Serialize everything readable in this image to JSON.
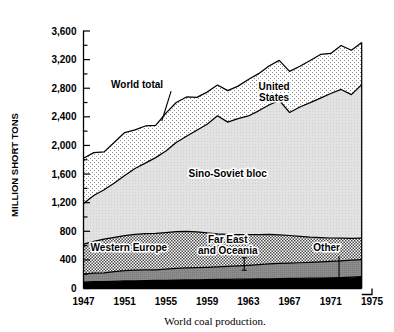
{
  "chart_data": {
    "type": "area",
    "stacked": true,
    "title": "",
    "caption": "World coal production.",
    "xlabel": "",
    "ylabel": "MILLION SHORT TONS",
    "xlim": [
      1947,
      1975
    ],
    "ylim": [
      0,
      3600
    ],
    "grid": false,
    "legend": "inline-labels",
    "y_ticks_major": [
      "0",
      "400",
      "800",
      "1,200",
      "1,600",
      "2,000",
      "2,400",
      "2,800",
      "3,200",
      "3,600"
    ],
    "y_ticks_major_values": [
      0,
      400,
      800,
      1200,
      1600,
      2000,
      2400,
      2800,
      3200,
      3600
    ],
    "y_ticks_minor_values": [
      200,
      600,
      1000,
      1400,
      1800,
      2200,
      2600,
      3000,
      3400
    ],
    "x_ticks": [
      "1947",
      "1951",
      "1955",
      "1959",
      "1963",
      "1967",
      "1971",
      "1975"
    ],
    "x_tick_values": [
      1947,
      1951,
      1955,
      1959,
      1963,
      1967,
      1971,
      1975
    ],
    "x": [
      1947,
      1948,
      1949,
      1950,
      1951,
      1952,
      1953,
      1954,
      1955,
      1956,
      1957,
      1958,
      1959,
      1960,
      1961,
      1962,
      1963,
      1964,
      1965,
      1966,
      1967,
      1968,
      1969,
      1970,
      1971,
      1972,
      1973,
      1974
    ],
    "series": [
      {
        "name": "Other",
        "fill": "black",
        "values": [
          90,
          95,
          95,
          100,
          105,
          108,
          110,
          112,
          115,
          118,
          120,
          122,
          124,
          126,
          128,
          130,
          132,
          134,
          136,
          138,
          140,
          142,
          144,
          146,
          148,
          152,
          158,
          165
        ]
      },
      {
        "name": "Far East and Oceania",
        "fill": "dark-gray",
        "values": [
          110,
          120,
          125,
          135,
          145,
          150,
          152,
          150,
          155,
          162,
          168,
          170,
          172,
          176,
          180,
          186,
          192,
          200,
          208,
          212,
          216,
          218,
          222,
          226,
          230,
          235,
          238,
          240
        ]
      },
      {
        "name": "Western Europe",
        "fill": "checker",
        "values": [
          420,
          445,
          470,
          480,
          490,
          500,
          505,
          508,
          512,
          515,
          510,
          500,
          480,
          462,
          448,
          438,
          428,
          420,
          412,
          400,
          385,
          368,
          352,
          340,
          328,
          316,
          305,
          300
        ]
      },
      {
        "name": "Sino-Soviet bloc",
        "fill": "light-gray",
        "values": [
          570,
          640,
          690,
          760,
          840,
          920,
          985,
          1060,
          1140,
          1245,
          1330,
          1420,
          1520,
          1650,
          1570,
          1620,
          1660,
          1730,
          1810,
          1880,
          1720,
          1810,
          1880,
          1950,
          2020,
          2080,
          2010,
          2145
        ]
      },
      {
        "name": "United States",
        "fill": "fine-dot",
        "values": [
          630,
          600,
          530,
          570,
          600,
          540,
          520,
          450,
          530,
          560,
          550,
          460,
          450,
          430,
          440,
          455,
          510,
          520,
          545,
          560,
          575,
          570,
          590,
          610,
          560,
          615,
          620,
          590
        ]
      }
    ],
    "totals": [
      1820,
      1900,
      1910,
      2045,
      2180,
      2218,
      2252,
      2280,
      2452,
      2600,
      2678,
      2672,
      2746,
      2844,
      2766,
      2829,
      2922,
      3004,
      3111,
      3190,
      3036,
      3108,
      3188,
      3272,
      3286,
      3398,
      3331,
      3440
    ],
    "annotations": [
      {
        "text": "World total",
        "x": 1952.2,
        "y": 2800,
        "leader": true
      },
      {
        "text_lines": [
          "United",
          "States"
        ],
        "x": 1965.5,
        "y": 2780
      },
      {
        "text": "Sino-Soviet bloc",
        "x": 1961.0,
        "y": 1560
      },
      {
        "text": "Western Europe",
        "x": 1951.4,
        "y": 520
      },
      {
        "text_lines": [
          "Far East",
          "and Oceania"
        ],
        "x": 1961.0,
        "y": 640,
        "pointer": true
      },
      {
        "text": "Other",
        "x": 1970.6,
        "y": 520,
        "pointer": true
      }
    ]
  },
  "axis": {
    "y_title": "MILLION SHORT TONS"
  },
  "caption": {
    "text": "World coal production."
  }
}
